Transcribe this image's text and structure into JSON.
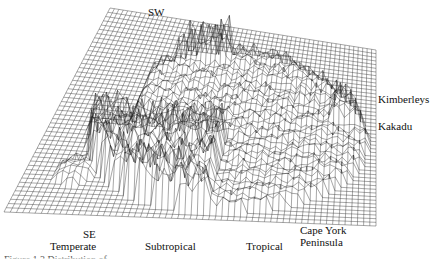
{
  "figure": {
    "type": "3d-wireframe-surface",
    "line_color": "#1a1a1a",
    "background": "#ffffff",
    "labels": {
      "sw": "SW",
      "kimberleys": "Kimberleys",
      "kakadu": "Kakadu",
      "se": "SE",
      "temperate": "Temperate",
      "subtropical": "Subtropical",
      "tropical": "Tropical",
      "cape_york_line1": "Cape York",
      "cape_york_line2": "Peninsula"
    },
    "caption": "Figure 1.3  Distribution of ..."
  }
}
